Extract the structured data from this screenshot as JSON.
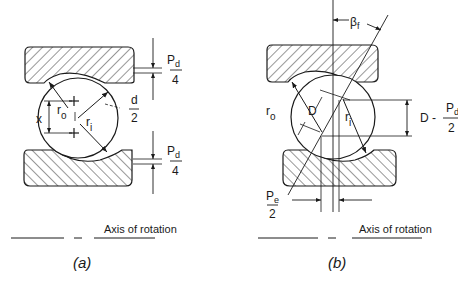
{
  "figure_a": {
    "caption": "(a)",
    "axis_label": "Axis of rotation",
    "labels": {
      "pd_top_num": "P",
      "pd_top_sub": "d",
      "pd_top_den": "4",
      "d_num": "d",
      "d_den": "2",
      "x": "x",
      "ro": "r",
      "ro_sub": "o",
      "ri": "r",
      "ri_sub": "i",
      "pd_bot_num": "P",
      "pd_bot_sub": "d",
      "pd_bot_den": "4"
    }
  },
  "figure_b": {
    "caption": "(b)",
    "axis_label": "Axis of rotation",
    "labels": {
      "beta": "β",
      "beta_sub": "f",
      "ro": "r",
      "ro_sub": "o",
      "D": "D",
      "ri": "r",
      "ri_sub": "i",
      "dim_right": "D -",
      "dim_right_num": "P",
      "dim_right_sub": "d",
      "dim_right_den": "2",
      "pe_num": "P",
      "pe_sub": "e",
      "pe_den": "2"
    }
  },
  "colors": {
    "ink": "#1a1a1a",
    "background": "#ffffff"
  }
}
